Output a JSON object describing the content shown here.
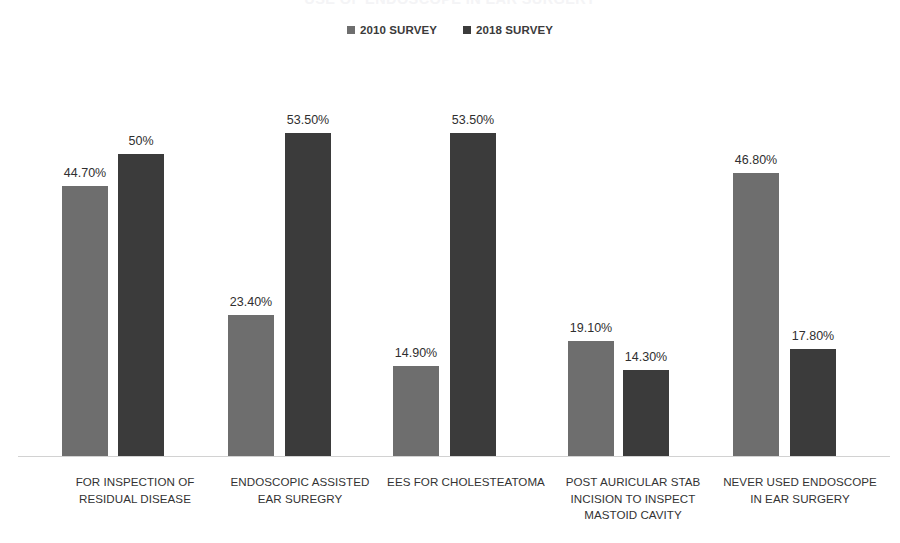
{
  "chart_data": {
    "type": "bar",
    "title": "USE OF ENDOSCOPE IN EAR SURGERY",
    "categories": [
      "FOR INSPECTION OF RESIDUAL DISEASE",
      "ENDOSCOPIC ASSISTED EAR SUREGRY",
      "EES FOR CHOLESTEATOMA",
      "POST AURICULAR STAB INCISION TO INSPECT MASTOID CAVITY",
      "NEVER USED ENDOSCOPE IN EAR SURGERY"
    ],
    "category_lines": [
      [
        "FOR INSPECTION OF",
        "RESIDUAL DISEASE"
      ],
      [
        "ENDOSCOPIC ASSISTED",
        "EAR SUREGRY"
      ],
      [
        "EES FOR CHOLESTEATOMA"
      ],
      [
        "POST AURICULAR STAB",
        "INCISION TO INSPECT",
        "MASTOID CAVITY"
      ],
      [
        "NEVER USED ENDOSCOPE",
        "IN EAR SURGERY"
      ]
    ],
    "series": [
      {
        "name": "2010 SURVEY",
        "color": "#6e6e6e",
        "values": [
          44.7,
          23.4,
          14.9,
          19.1,
          46.8
        ],
        "labels": [
          "44.70%",
          "23.40%",
          "14.90%",
          "19.10%",
          "46.80%"
        ]
      },
      {
        "name": "2018 SURVEY",
        "color": "#3b3b3b",
        "values": [
          50.0,
          53.5,
          53.5,
          14.3,
          17.8
        ],
        "labels": [
          "50%",
          "53.50%",
          "53.50%",
          "14.30%",
          "17.80%"
        ]
      }
    ],
    "xlabel": "",
    "ylabel": "",
    "ylim": [
      0,
      53.5
    ],
    "grid": false,
    "axis_visible": true,
    "y_axis_labels_visible": false,
    "legend_position": "top",
    "data_labels": true
  },
  "legend": {
    "items": [
      {
        "label": "2010 SURVEY",
        "color": "#6e6e6e"
      },
      {
        "label": "2018 SURVEY",
        "color": "#3b3b3b"
      }
    ]
  },
  "geometry": {
    "baseline_y": 456,
    "px_per_percent": 6.037,
    "bar_width": 46,
    "group_light_x": [
      62,
      228,
      393,
      568,
      733
    ],
    "group_dark_x": [
      118,
      285,
      450,
      623,
      790
    ],
    "label_centers": [
      135,
      300,
      466,
      633,
      800
    ],
    "label_widths": [
      220,
      225,
      215,
      200,
      200
    ]
  }
}
